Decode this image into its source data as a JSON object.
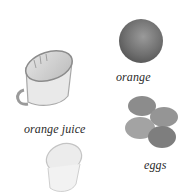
{
  "illustration": {
    "items": [
      {
        "id": "orange",
        "label": "orange"
      },
      {
        "id": "orange-juice",
        "label": "orange juice"
      },
      {
        "id": "eggs",
        "label": "eggs"
      },
      {
        "id": "bowl",
        "label": ""
      }
    ],
    "colors": {
      "background": "#ffffff",
      "orange": "#7a7a7a",
      "eggs": "#8e8e8e",
      "juice": "#cfcfcf",
      "text": "#2a2a2a"
    }
  }
}
